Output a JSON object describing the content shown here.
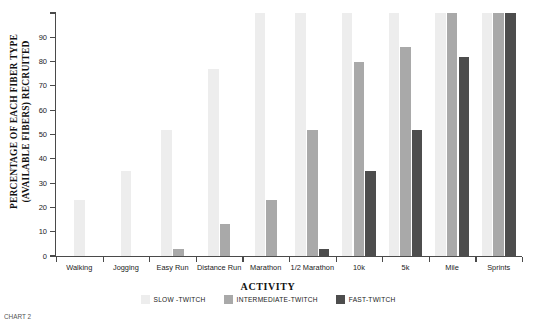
{
  "chart_data": {
    "type": "bar",
    "title": "",
    "xlabel": "ACTIVITY",
    "ylabel": "PERCENTAGE OF EACH FIBER TYPE (AVAILABLE FIBERS) RECRUITED",
    "ylabel_line1": "PERCENTAGE OF EACH FIBER TYPE",
    "ylabel_line2": "(AVAILABLE FIBERS) RECRUITED",
    "ylim": [
      0,
      100
    ],
    "yticks": [
      0,
      10,
      20,
      30,
      40,
      50,
      60,
      70,
      80,
      90,
      100
    ],
    "ytick_labels": [
      "0",
      "10",
      "20",
      "30",
      "40",
      "50",
      "60",
      "70",
      "80",
      "90",
      ""
    ],
    "grid": false,
    "legend_position": "bottom",
    "categories": [
      "Walking",
      "Jogging",
      "Easy Run",
      "Distance Run",
      "Marathon",
      "1/2 Marathon",
      "10k",
      "5k",
      "Mile",
      "Sprints"
    ],
    "series": [
      {
        "name": "SLOW -TWITCH",
        "color": "#ededed",
        "values": [
          23,
          35,
          52,
          77,
          100,
          100,
          100,
          100,
          100,
          100
        ]
      },
      {
        "name": "INTERMEDIATE-TWITCH",
        "color": "#a9a9a9",
        "values": [
          0,
          0,
          3,
          13,
          23,
          52,
          80,
          86,
          100,
          100
        ]
      },
      {
        "name": "FAST-TWITCH",
        "color": "#4d4d4d",
        "values": [
          0,
          0,
          0,
          0,
          0,
          3,
          35,
          52,
          82,
          100
        ]
      }
    ]
  },
  "caption": {
    "text": "CHART 2"
  }
}
